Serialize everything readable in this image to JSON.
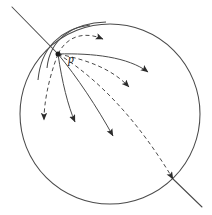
{
  "figure": {
    "title": "",
    "caption": "",
    "kind": "geometric-diagram",
    "background_color": "#ffffff",
    "stroke_color": "#3a3a3a",
    "label_color": "#1a1a1a",
    "width": 212,
    "height": 215
  },
  "labels": {
    "point_p": "p"
  },
  "geometry": {
    "boundary_circle": {
      "name": "boundary-circle",
      "cx": 110,
      "cy": 114,
      "r": 90,
      "style": "solid"
    },
    "base_point": {
      "name": "point-p",
      "x": 58,
      "y": 54,
      "radius": 2.4
    },
    "secant_line": {
      "name": "secant-line",
      "x1": 12,
      "y1": 7,
      "x2": 202,
      "y2": 207,
      "style": "solid"
    },
    "secant_line_visible_segments": [
      {
        "x1": 12,
        "y1": 7,
        "x2": 58,
        "y2": 54
      },
      {
        "x1": 171,
        "y1": 177,
        "x2": 202,
        "y2": 207
      }
    ],
    "small_arc": {
      "name": "small-arc-near-p",
      "d": "M 47 66 C 52 36, 76 24, 105 23",
      "style": "solid"
    },
    "secondary_arc": {
      "name": "secondary-arc-near-p",
      "d": "M 40 74 C 44 46, 62 30, 92 26",
      "style": "solid"
    },
    "rays": [
      {
        "name": "ray-1-dashed-up-right",
        "style": "dashed",
        "d": "M 58 54 C 66 36, 82 32, 104 40",
        "arrow_at": {
          "x": 106,
          "y": 41
        },
        "arrow_angle": 22
      },
      {
        "name": "ray-2-solid-right",
        "style": "solid",
        "d": "M 58 54 C 92 54, 128 58, 150 74",
        "arrow_at": {
          "x": 151,
          "y": 75
        },
        "arrow_angle": 40
      },
      {
        "name": "ray-3-dashed-right-down",
        "style": "dashed",
        "d": "M 58 54 C 88 60, 112 68, 131 89",
        "arrow_at": {
          "x": 132,
          "y": 90
        },
        "arrow_angle": 50
      },
      {
        "name": "ray-4-dashed-long-down-right",
        "style": "dashed",
        "d": "M 58 54 C 98 78, 138 120, 174 180",
        "arrow_at": {
          "x": 175,
          "y": 182
        },
        "arrow_angle": 60
      },
      {
        "name": "ray-5-solid-down-right",
        "style": "solid",
        "d": "M 58 54 C 76 76, 96 106, 114 138",
        "arrow_at": {
          "x": 115,
          "y": 140
        },
        "arrow_angle": 62
      },
      {
        "name": "ray-6-solid-down",
        "style": "solid",
        "d": "M 58 54 C 62 82, 68 106, 76 124",
        "arrow_at": {
          "x": 77,
          "y": 126
        },
        "arrow_angle": 72
      },
      {
        "name": "ray-7-dashed-down-left",
        "style": "dashed",
        "d": "M 58 54 C 48 80, 44 104, 45 122",
        "arrow_at": {
          "x": 45,
          "y": 124
        },
        "arrow_angle": 96
      }
    ]
  }
}
